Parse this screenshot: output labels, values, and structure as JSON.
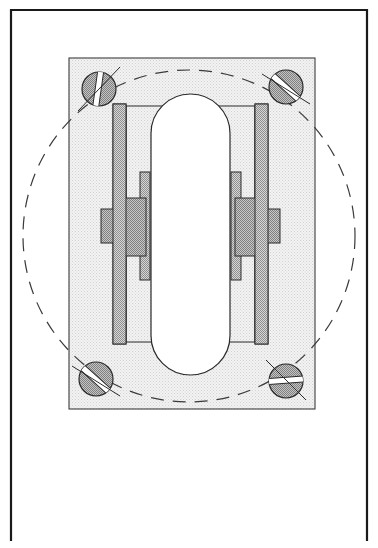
{
  "document": {
    "kind": "patent-figure",
    "title": "",
    "background_color": "#ffffff"
  },
  "frame": {
    "name": "drawing-sheet-border",
    "stroke_color": "#1a1a1a",
    "stroke_width": 2.2,
    "left": 11,
    "top": 10,
    "right": 367,
    "bottom": 540,
    "has_bottom_edge": false
  },
  "palette": {
    "outline": "#1f1f1f",
    "hatch_light": "#ededed",
    "hatch_medium": "#b9b9b9",
    "hatch_dark": "#9e9e9e",
    "white_fill": "#ffffff",
    "dashed_stroke": "#3a3a3a"
  },
  "base_plate": {
    "name": "mounting-base-plate",
    "x": 69,
    "y": 58,
    "width": 246,
    "height": 351,
    "fill": "#ededed",
    "stroke": "#3d3d3d",
    "stroke_width": 1.1
  },
  "bolt_circle": {
    "name": "bolt-circle-dashed",
    "cx": 189,
    "cy": 236,
    "rx": 166,
    "ry": 166,
    "stroke": "#3a3a3a",
    "stroke_width": 1.2,
    "dash_pattern": "13 9"
  },
  "screws": [
    {
      "name": "screw-top-left",
      "cx": 99,
      "cy": 89,
      "r": 17,
      "slot_angle_deg": 82,
      "fill": "#a8a8a8",
      "slot_fill": "#ffffff"
    },
    {
      "name": "screw-top-right",
      "cx": 286,
      "cy": 87,
      "r": 17,
      "slot_angle_deg": 140,
      "fill": "#a8a8a8",
      "slot_fill": "#ffffff"
    },
    {
      "name": "screw-bottom-left",
      "cx": 96,
      "cy": 379,
      "r": 17,
      "slot_angle_deg": 140,
      "fill": "#a8a8a8",
      "slot_fill": "#ffffff"
    },
    {
      "name": "screw-bottom-right",
      "cx": 286,
      "cy": 381,
      "r": 17,
      "slot_angle_deg": 4,
      "fill": "#a8a8a8",
      "slot_fill": "#ffffff"
    }
  ],
  "outer_side_plates": [
    {
      "name": "side-plate-left-outer",
      "x": 113,
      "y": 104,
      "width": 13,
      "height": 240,
      "fill": "#b0b0b0",
      "stroke": "#2a2a2a"
    },
    {
      "name": "side-plate-right-outer",
      "x": 255,
      "y": 104,
      "width": 13,
      "height": 240,
      "fill": "#b0b0b0",
      "stroke": "#2a2a2a"
    }
  ],
  "inner_side_plates": [
    {
      "name": "side-plate-left-inner",
      "x": 140,
      "y": 172,
      "width": 10,
      "height": 108,
      "fill": "#b0b0b0",
      "stroke": "#2a2a2a"
    },
    {
      "name": "side-plate-right-inner",
      "x": 231,
      "y": 172,
      "width": 10,
      "height": 108,
      "fill": "#b0b0b0",
      "stroke": "#2a2a2a"
    }
  ],
  "bearing_blocks": [
    {
      "name": "bearing-block-left",
      "x": 124,
      "y": 198,
      "width": 22,
      "height": 58,
      "fill": "#a6a6a6",
      "stroke": "#2a2a2a"
    },
    {
      "name": "bearing-block-right",
      "x": 235,
      "y": 198,
      "width": 22,
      "height": 58,
      "fill": "#a6a6a6",
      "stroke": "#2a2a2a"
    }
  ],
  "axle_tabs": [
    {
      "name": "axle-tab-left",
      "x": 101,
      "y": 209,
      "width": 13,
      "height": 34,
      "fill": "#a6a6a6",
      "stroke": "#2a2a2a"
    },
    {
      "name": "axle-tab-right",
      "x": 267,
      "y": 209,
      "width": 13,
      "height": 34,
      "fill": "#a6a6a6",
      "stroke": "#2a2a2a"
    }
  ],
  "body_panel": {
    "name": "center-body-panel",
    "x": 126,
    "y": 106,
    "width": 129,
    "height": 236,
    "fill": "#ededed",
    "stroke": "#2a2a2a"
  },
  "roller": {
    "name": "roller-stadium-profile",
    "x": 151,
    "y": 94,
    "width": 79,
    "height": 281,
    "radius": 39.5,
    "fill": "#ffffff",
    "stroke": "#2a2a2a",
    "stroke_width": 1.2
  },
  "labels": {
    "figure_number": "",
    "reference_numerals": []
  }
}
